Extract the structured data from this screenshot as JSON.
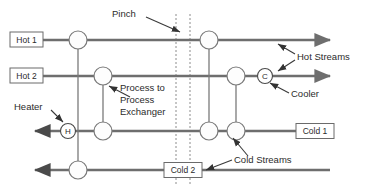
{
  "diagram": {
    "colors": {
      "stream": "#6e6e6e",
      "connector": "#7a7a7a",
      "node_fill": "#fdfdfd",
      "text": "#2b2b2b",
      "pinch": "#8c8c8c",
      "background": "#ffffff"
    },
    "annotations": {
      "pinch": "Pinch",
      "hot_streams": "Hot Streams",
      "cooler": "Cooler",
      "heater": "Heater",
      "cold_streams": "Cold Streams",
      "process_to_process_exchanger_line1": "Process to",
      "process_to_process_exchanger_line2": "Process",
      "process_to_process_exchanger_line3": "Exchanger"
    },
    "stream_tags": {
      "hot1": "Hot 1",
      "hot2": "Hot 2",
      "cold1": "Cold 1",
      "cold2": "Cold 2"
    },
    "units": {
      "heater_symbol": "H",
      "cooler_symbol": "C"
    },
    "streams": [
      {
        "id": "hot1",
        "label": "Hot 1",
        "type": "hot",
        "direction": "left-to-right",
        "y": 40
      },
      {
        "id": "hot2",
        "label": "Hot 2",
        "type": "hot",
        "direction": "left-to-right",
        "y": 76
      },
      {
        "id": "cold1",
        "label": "Cold 1",
        "type": "cold",
        "direction": "right-to-left",
        "y": 131
      },
      {
        "id": "cold2",
        "label": "Cold 2",
        "type": "cold",
        "direction": "right-to-left",
        "y": 170
      }
    ],
    "exchangers": [
      {
        "id": "ex-1",
        "kind": "process-to-process",
        "hot_stream": "hot1",
        "cold_stream": "cold2",
        "side": "below-pinch"
      },
      {
        "id": "ex-2",
        "kind": "process-to-process",
        "hot_stream": "hot2",
        "cold_stream": "cold1",
        "side": "below-pinch"
      },
      {
        "id": "ex-3",
        "kind": "process-to-process",
        "hot_stream": "hot1",
        "cold_stream": "cold1",
        "side": "above-pinch"
      },
      {
        "id": "ex-4",
        "kind": "process-to-process",
        "hot_stream": "hot2",
        "cold_stream": "cold1",
        "side": "above-pinch"
      },
      {
        "id": "heater-1",
        "kind": "heater",
        "symbol": "H",
        "cold_stream": "cold1"
      },
      {
        "id": "cooler-1",
        "kind": "cooler",
        "symbol": "C",
        "hot_stream": "hot2"
      }
    ]
  }
}
